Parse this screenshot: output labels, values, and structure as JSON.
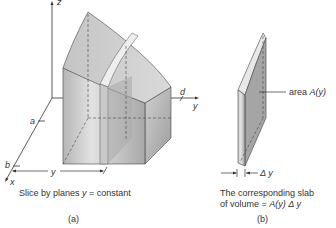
{
  "figure_a": {
    "axis_z": "z",
    "axis_x": "x",
    "axis_y": "y",
    "label_a": "a",
    "label_b": "b",
    "label_d": "d",
    "label_y_dim": "y",
    "caption": "Slice by planes y = constant",
    "caption_prefix": "Slice by planes ",
    "caption_var": "y",
    "caption_suffix": " = constant",
    "tag": "(a)"
  },
  "figure_b": {
    "area_label_prefix": "area ",
    "area_label_expr": "A(y)",
    "delta_label": "Δ y",
    "caption_line1": "The corresponding slab",
    "caption_line2_prefix": "of volume = ",
    "caption_line2_expr": "A(y) Δ y",
    "tag": "(b)"
  },
  "colors": {
    "solid_light": "#d9d9d9",
    "solid_mid": "#b8b8b8",
    "solid_dark": "#9a9a9a",
    "slab_highlight": "#ececec",
    "line": "#333333"
  }
}
